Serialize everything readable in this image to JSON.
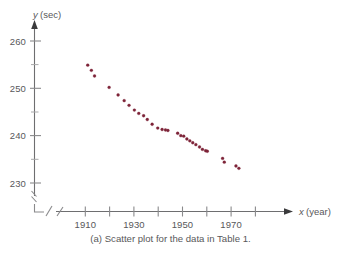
{
  "figure": {
    "caption": "(a) Scatter plot for the data in Table 1.",
    "background_color": "#ffffff",
    "point_color": "#7d2338",
    "axis_color": "#6e6e70"
  },
  "axes": {
    "y_label_var": "y",
    "y_label_unit": "(sec)",
    "x_label_var": "x",
    "x_label_unit": "(year)",
    "y_ticks": [
      "230",
      "240",
      "250",
      "260"
    ],
    "x_ticks": [
      "1910",
      "1930",
      "1950",
      "1970"
    ],
    "axis_break": "zigzag"
  },
  "chart_data": {
    "type": "scatter",
    "title": "",
    "xlabel": "x (year)",
    "ylabel": "y (sec)",
    "xlim": [
      1900,
      1985
    ],
    "ylim": [
      226,
      262
    ],
    "xticks": [
      1910,
      1920,
      1930,
      1940,
      1950,
      1960,
      1970,
      1980
    ],
    "xticklabels": [
      "1910",
      "",
      "1930",
      "",
      "1950",
      "",
      "1970",
      ""
    ],
    "yticks": [
      230,
      235,
      240,
      245,
      250,
      255,
      260
    ],
    "yticklabels": [
      "230",
      "",
      "240",
      "",
      "250",
      "",
      "260"
    ],
    "grid": false,
    "legend": null,
    "series": [
      {
        "name": "record time",
        "points": [
          [
            1911.0,
            254.9
          ],
          [
            1912.5,
            253.8
          ],
          [
            1913.8,
            252.6
          ],
          [
            1919.8,
            250.2
          ],
          [
            1923.5,
            248.6
          ],
          [
            1926.0,
            247.4
          ],
          [
            1928.0,
            246.4
          ],
          [
            1930.2,
            245.4
          ],
          [
            1932.0,
            244.7
          ],
          [
            1934.0,
            244.2
          ],
          [
            1935.5,
            243.4
          ],
          [
            1937.5,
            242.4
          ],
          [
            1939.8,
            241.6
          ],
          [
            1941.6,
            241.3
          ],
          [
            1943.0,
            241.2
          ],
          [
            1944.0,
            241.1
          ],
          [
            1948.0,
            240.5
          ],
          [
            1949.3,
            240.0
          ],
          [
            1950.5,
            239.9
          ],
          [
            1951.8,
            239.3
          ],
          [
            1953.0,
            238.9
          ],
          [
            1954.2,
            238.5
          ],
          [
            1955.5,
            238.1
          ],
          [
            1957.0,
            237.6
          ],
          [
            1958.2,
            237.1
          ],
          [
            1959.5,
            236.8
          ],
          [
            1960.2,
            236.7
          ],
          [
            1966.5,
            235.2
          ],
          [
            1967.2,
            234.4
          ],
          [
            1972.0,
            233.6
          ],
          [
            1973.2,
            233.1
          ]
        ]
      }
    ]
  }
}
